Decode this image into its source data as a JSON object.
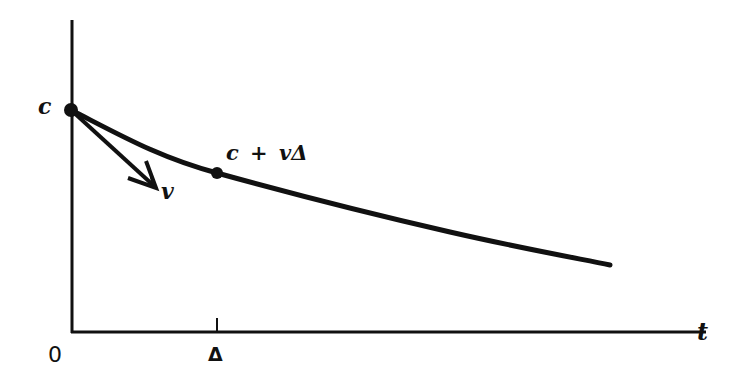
{
  "diagram": {
    "type": "curve-with-tangent",
    "colors": {
      "ink": "#111111",
      "background": "#ffffff"
    },
    "axes": {
      "x_label": "t",
      "origin_label": "0",
      "x_tick_label": "Δ",
      "y_label": "c"
    },
    "annotations": {
      "start_point_label": "c",
      "tangent_label": "v",
      "point_label": "c + vΔ"
    },
    "geometry": {
      "origin": [
        72,
        332
      ],
      "y_axis_top": [
        72,
        20
      ],
      "x_axis_end": [
        706,
        332
      ],
      "tick": [
        217,
        318,
        217,
        332
      ],
      "curve_start": [
        71,
        110
      ],
      "curve_point_delta": [
        217,
        173
      ],
      "curve_end": [
        610,
        265
      ],
      "tangent_arrow_tip": [
        155,
        187
      ]
    }
  }
}
